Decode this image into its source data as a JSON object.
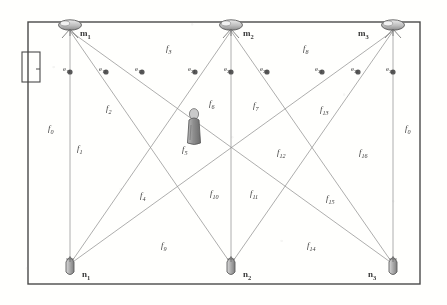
{
  "figure": {
    "ink_color": "#4a4a4a",
    "label_color": "#3a3a3a",
    "room": {
      "x": 28,
      "y": 22,
      "width": 392,
      "height": 262
    }
  },
  "door": {
    "name": "door",
    "x": 22,
    "y": 52,
    "width": 18,
    "height": 30
  },
  "person": {
    "name": "person-figure",
    "x": 190,
    "y": 110
  },
  "cameras": [
    {
      "id": "m1",
      "base": "m",
      "sub": "1",
      "x": 70,
      "y": 25,
      "label_x": 80,
      "label_y": 29
    },
    {
      "id": "m2",
      "base": "m",
      "sub": "2",
      "x": 231,
      "y": 25,
      "label_x": 243,
      "label_y": 29
    },
    {
      "id": "m3",
      "base": "m",
      "sub": "3",
      "x": 393,
      "y": 25,
      "label_x": 358,
      "label_y": 29
    }
  ],
  "nodes": [
    {
      "id": "n1",
      "base": "n",
      "sub": "1",
      "x": 70,
      "y": 268,
      "label_x": 82,
      "label_y": 270
    },
    {
      "id": "n2",
      "base": "n",
      "sub": "2",
      "x": 231,
      "y": 268,
      "label_x": 243,
      "label_y": 270
    },
    {
      "id": "n3",
      "base": "n",
      "sub": "3",
      "x": 393,
      "y": 268,
      "label_x": 368,
      "label_y": 270
    }
  ],
  "edge_points": [
    {
      "id": "e11",
      "base": "e",
      "sub": "11",
      "x": 70,
      "y": 72,
      "label_x": 63,
      "label_y": 66
    },
    {
      "id": "e12",
      "base": "e",
      "sub": "12",
      "x": 106,
      "y": 72,
      "label_x": 99,
      "label_y": 66
    },
    {
      "id": "e13",
      "base": "e",
      "sub": "13",
      "x": 142,
      "y": 72,
      "label_x": 135,
      "label_y": 66
    },
    {
      "id": "e21",
      "base": "e",
      "sub": "21",
      "x": 195,
      "y": 72,
      "label_x": 188,
      "label_y": 66
    },
    {
      "id": "e22",
      "base": "e",
      "sub": "22",
      "x": 231,
      "y": 72,
      "label_x": 224,
      "label_y": 66
    },
    {
      "id": "e23",
      "base": "e",
      "sub": "23",
      "x": 267,
      "y": 72,
      "label_x": 260,
      "label_y": 66
    },
    {
      "id": "e31",
      "base": "e",
      "sub": "31",
      "x": 322,
      "y": 72,
      "label_x": 315,
      "label_y": 66
    },
    {
      "id": "e32",
      "base": "e",
      "sub": "32",
      "x": 358,
      "y": 72,
      "label_x": 351,
      "label_y": 66
    },
    {
      "id": "e33",
      "base": "e",
      "sub": "33",
      "x": 393,
      "y": 72,
      "label_x": 386,
      "label_y": 66
    }
  ],
  "regions": [
    {
      "id": "f0L",
      "base": "f",
      "sub": "0",
      "x": 48,
      "y": 124
    },
    {
      "id": "f1",
      "base": "f",
      "sub": "1",
      "x": 77,
      "y": 144
    },
    {
      "id": "f2",
      "base": "f",
      "sub": "2",
      "x": 106,
      "y": 104
    },
    {
      "id": "f3",
      "base": "f",
      "sub": "3",
      "x": 166,
      "y": 44
    },
    {
      "id": "f4",
      "base": "f",
      "sub": "4",
      "x": 140,
      "y": 191
    },
    {
      "id": "f5",
      "base": "f",
      "sub": "5",
      "x": 182,
      "y": 145
    },
    {
      "id": "f6",
      "base": "f",
      "sub": "6",
      "x": 209,
      "y": 99
    },
    {
      "id": "f7",
      "base": "f",
      "sub": "7",
      "x": 253,
      "y": 101
    },
    {
      "id": "f8",
      "base": "f",
      "sub": "8",
      "x": 303,
      "y": 44
    },
    {
      "id": "f9",
      "base": "f",
      "sub": "9",
      "x": 161,
      "y": 241
    },
    {
      "id": "f10",
      "base": "f",
      "sub": "10",
      "x": 210,
      "y": 189
    },
    {
      "id": "f11",
      "base": "f",
      "sub": "11",
      "x": 250,
      "y": 189
    },
    {
      "id": "f12",
      "base": "f",
      "sub": "12",
      "x": 277,
      "y": 148
    },
    {
      "id": "f13",
      "base": "f",
      "sub": "13",
      "x": 320,
      "y": 105
    },
    {
      "id": "f14",
      "base": "f",
      "sub": "14",
      "x": 307,
      "y": 241
    },
    {
      "id": "f15",
      "base": "f",
      "sub": "15",
      "x": 326,
      "y": 194
    },
    {
      "id": "f16",
      "base": "f",
      "sub": "16",
      "x": 359,
      "y": 148
    },
    {
      "id": "f0R",
      "base": "f",
      "sub": "0",
      "x": 405,
      "y": 124
    }
  ]
}
